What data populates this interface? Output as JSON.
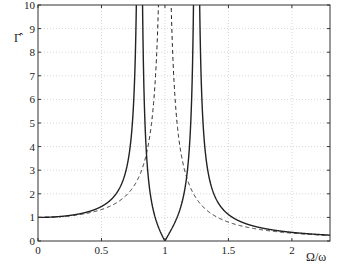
{
  "chart_data": {
    "type": "line",
    "title": "",
    "xlabel": "Ω/ω",
    "ylabel": "Γ̂",
    "xlim": [
      0,
      2.3
    ],
    "ylim": [
      0,
      10
    ],
    "grid": true,
    "legend": null,
    "xticks": [
      "0",
      "0.5",
      "1",
      "1.5",
      "2"
    ],
    "yticks": [
      "0",
      "1",
      "2",
      "3",
      "4",
      "5",
      "6",
      "7",
      "8",
      "9",
      "10"
    ],
    "series": [
      {
        "name": "solid",
        "style": "solid",
        "description": "two resonance peaks near Ω/ω≈0.80 and ≈1.25, zero at Ω/ω=1",
        "x": [
          0,
          0.25,
          0.5,
          0.6,
          0.7,
          0.75,
          0.78,
          0.8,
          0.82,
          0.85,
          0.9,
          0.95,
          1.0,
          1.05,
          1.1,
          1.15,
          1.2,
          1.23,
          1.25,
          1.28,
          1.3,
          1.4,
          1.5,
          1.75,
          2.0,
          2.3
        ],
        "values": [
          1.0,
          1.08,
          1.46,
          2.0,
          3.6,
          6.5,
          12,
          50,
          12,
          5.5,
          2.3,
          1.0,
          0.0,
          1.1,
          2.5,
          4.9,
          12,
          30,
          50,
          15,
          8.4,
          3.2,
          2.0,
          0.96,
          0.57,
          0.25
        ]
      },
      {
        "name": "dashed",
        "style": "dashed",
        "description": "single resonance 1/|1-(Ω/ω)²|",
        "x": [
          0,
          0.25,
          0.5,
          0.6,
          0.7,
          0.8,
          0.85,
          0.9,
          0.95,
          1.0,
          1.05,
          1.1,
          1.15,
          1.2,
          1.3,
          1.4,
          1.5,
          1.75,
          2.0,
          2.3
        ],
        "values": [
          1.0,
          1.07,
          1.33,
          1.56,
          1.96,
          2.78,
          3.6,
          5.26,
          10.3,
          null,
          9.8,
          4.76,
          3.1,
          2.27,
          1.45,
          1.04,
          0.8,
          0.48,
          0.33,
          0.23
        ]
      }
    ]
  },
  "caption": "Figure (caption cut off)"
}
